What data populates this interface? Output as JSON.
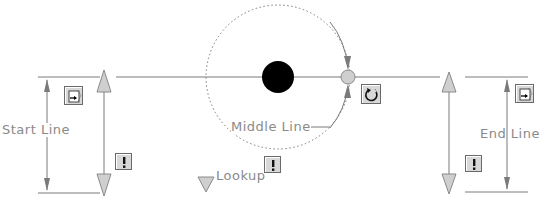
{
  "diagram": {
    "labels": {
      "start_line": "Start Line",
      "middle_line": "Middle Line",
      "end_line": "End Line",
      "lookup": "Lookup"
    },
    "icons": {
      "start_grip": "stretch-grip-icon",
      "end_grip": "stretch-grip-icon",
      "rotate": "rotate-icon",
      "warning_start": "exclamation-icon",
      "warning_lookup": "exclamation-icon",
      "warning_end": "exclamation-icon"
    },
    "colors": {
      "line": "#7a7a7a",
      "grip_fill": "#c8c8c8",
      "center_dot": "#000000",
      "text": "#8a8a8a"
    }
  }
}
